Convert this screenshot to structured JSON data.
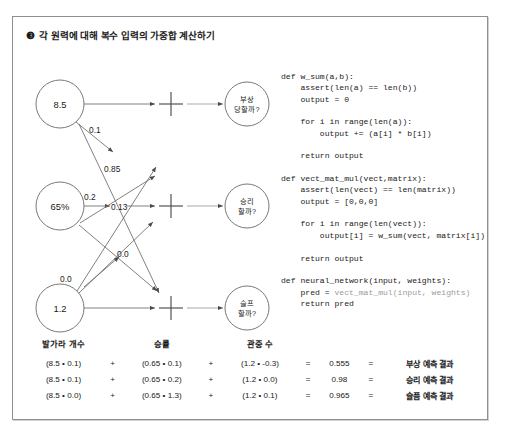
{
  "panel": {
    "title_marker": "❸",
    "title": "각 원력에 대해 복수 입력의 가중합 계산하기"
  },
  "diagram": {
    "inputs": [
      {
        "label": "8.5"
      },
      {
        "label": "65%"
      },
      {
        "label": "1.2"
      }
    ],
    "outputs": [
      {
        "line1": "부상",
        "line2": "당할까?"
      },
      {
        "line1": "승리",
        "line2": "할까?"
      },
      {
        "line1": "슬프",
        "line2": "할까?"
      }
    ],
    "weight_labels": [
      "0.1",
      "0.85",
      "0.2",
      "0.13",
      "0.0",
      "0.0"
    ],
    "sum_symbol": "+"
  },
  "code": {
    "lines": [
      {
        "text": "def w_sum(a,b):"
      },
      {
        "text": "    assert(len(a) == len(b))"
      },
      {
        "text": "    output = 0"
      },
      {
        "text": ""
      },
      {
        "text": "    for i in range(len(a)):"
      },
      {
        "text": "        output += (a[i] * b[i])"
      },
      {
        "text": ""
      },
      {
        "text": "    return output"
      },
      {
        "text": ""
      },
      {
        "text": "def vect_mat_mul(vect,matrix):"
      },
      {
        "text": "    assert(len(vect) == len(matrix))"
      },
      {
        "text": "    output = [0,0,0]"
      },
      {
        "text": ""
      },
      {
        "text": "    for i in range(len(vect)):"
      },
      {
        "text": "        output[i] = w_sum(vect, matrix[i])"
      },
      {
        "text": ""
      },
      {
        "text": "    return output"
      },
      {
        "text": ""
      },
      {
        "text": "def neural_network(input, weights):"
      },
      {
        "text": "    pred = ",
        "dim": "vect_mat_mul(input, weights)"
      },
      {
        "text": "    return pred"
      }
    ]
  },
  "calc": {
    "headers": [
      "발가라 개수",
      "승률",
      "관중 수"
    ],
    "rows": [
      {
        "term1": "(8.5 • 0.1)",
        "op1": "+",
        "term2": "(0.65 • 0.1)",
        "op2": "+",
        "term3": "(1.2 • -0.3)",
        "eq1": "=",
        "value": "0.555",
        "eq2": "=",
        "result": "부상 예측 결과"
      },
      {
        "term1": "(8.5 • 0.1)",
        "op1": "+",
        "term2": "(0.65 • 0.2)",
        "op2": "+",
        "term3": "(1.2 • 0.0)",
        "eq1": "=",
        "value": "0.98",
        "eq2": "=",
        "result": "승리 예측 결과"
      },
      {
        "term1": "(8.5 • 0.0)",
        "op1": "+",
        "term2": "(0.65 • 1.3)",
        "op2": "+",
        "term3": "(1.2 • 0.1)",
        "eq1": "=",
        "value": "0.965",
        "eq2": "=",
        "result": "슬픔 예측 결과"
      }
    ]
  },
  "colors": {
    "border": "#8e8e93",
    "text": "#1a1a1a",
    "code_dim": "#9b9b9b",
    "stroke": "#58595b"
  }
}
